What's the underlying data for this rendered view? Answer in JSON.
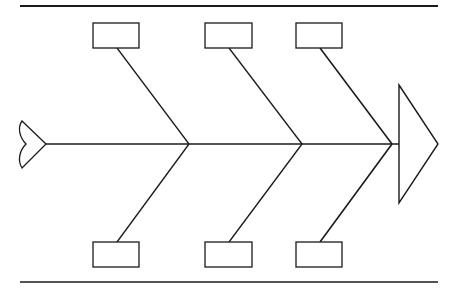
{
  "diagram": {
    "type": "fishbone",
    "colors": {
      "line": "#1a1a1a",
      "background": "#ffffff"
    },
    "borders": {
      "top": {
        "x1": 20,
        "x2": 438,
        "y": 6
      },
      "bottom": {
        "x1": 20,
        "x2": 438,
        "y": 282
      }
    },
    "spine": {
      "x1": 46,
      "x2": 399,
      "y": 144
    },
    "head": {
      "points": "399,85 438,144 399,203",
      "label": ""
    },
    "tail": {
      "label": ""
    },
    "categories": [
      {
        "id": "cause-top-1",
        "position": "top",
        "label": "",
        "box": {
          "x": 93,
          "y": 23,
          "w": 46,
          "h": 25
        },
        "rib": {
          "x1": 117,
          "y1": 48,
          "x2": 189,
          "y2": 144
        }
      },
      {
        "id": "cause-top-2",
        "position": "top",
        "label": "",
        "box": {
          "x": 205,
          "y": 23,
          "w": 47,
          "h": 25
        },
        "rib": {
          "x1": 229,
          "y1": 48,
          "x2": 302,
          "y2": 144
        }
      },
      {
        "id": "cause-top-3",
        "position": "top",
        "label": "",
        "box": {
          "x": 296,
          "y": 23,
          "w": 46,
          "h": 25
        },
        "rib": {
          "x1": 320,
          "y1": 48,
          "x2": 392,
          "y2": 144
        }
      },
      {
        "id": "cause-bottom-1",
        "position": "bottom",
        "label": "",
        "box": {
          "x": 93,
          "y": 242,
          "w": 46,
          "h": 25
        },
        "rib": {
          "x1": 189,
          "y1": 144,
          "x2": 117,
          "y2": 242
        }
      },
      {
        "id": "cause-bottom-2",
        "position": "bottom",
        "label": "",
        "box": {
          "x": 205,
          "y": 242,
          "w": 47,
          "h": 25
        },
        "rib": {
          "x1": 302,
          "y1": 144,
          "x2": 229,
          "y2": 242
        }
      },
      {
        "id": "cause-bottom-3",
        "position": "bottom",
        "label": "",
        "box": {
          "x": 296,
          "y": 242,
          "w": 46,
          "h": 25
        },
        "rib": {
          "x1": 392,
          "y1": 144,
          "x2": 320,
          "y2": 242
        }
      }
    ]
  }
}
